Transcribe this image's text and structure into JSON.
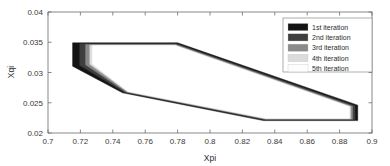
{
  "chart_data": {
    "type": "line",
    "title": "",
    "xlabel": "Xpi",
    "ylabel": "Xqi",
    "xlim": [
      0.7,
      0.9
    ],
    "ylim": [
      0.02,
      0.04
    ],
    "xticks": [
      "0.7",
      "0.72",
      "0.74",
      "0.76",
      "0.78",
      "0.8",
      "0.82",
      "0.84",
      "0.86",
      "0.88",
      "0.9"
    ],
    "xtick_values": [
      0.7,
      0.72,
      0.74,
      0.76,
      0.78,
      0.8,
      0.82,
      0.84,
      0.86,
      0.88,
      0.9
    ],
    "yticks": [
      "0.02",
      "0.025",
      "0.03",
      "0.035",
      "0.04"
    ],
    "ytick_values": [
      0.02,
      0.025,
      0.03,
      0.035,
      0.04
    ],
    "grid": false,
    "legend_position": "top-right",
    "series": [
      {
        "name": "1st iteration",
        "color": "#141414",
        "points": [
          [
            0.7152,
            0.0349
          ],
          [
            0.78,
            0.0349
          ],
          [
            0.8912,
            0.0246
          ],
          [
            0.8912,
            0.02205
          ],
          [
            0.833,
            0.02205
          ],
          [
            0.746,
            0.02665
          ],
          [
            0.7152,
            0.03105
          ]
        ]
      },
      {
        "name": "2nd iteration",
        "color": "#3f3f3f",
        "points": [
          [
            0.7196,
            0.03475
          ],
          [
            0.7795,
            0.03475
          ],
          [
            0.8895,
            0.0245
          ],
          [
            0.8895,
            0.02218
          ],
          [
            0.8335,
            0.02218
          ],
          [
            0.7472,
            0.02672
          ],
          [
            0.7196,
            0.03118
          ]
        ]
      },
      {
        "name": "3rd iteration",
        "color": "#8a8a8a",
        "points": [
          [
            0.7232,
            0.03462
          ],
          [
            0.779,
            0.03462
          ],
          [
            0.888,
            0.02442
          ],
          [
            0.888,
            0.02228
          ],
          [
            0.834,
            0.02228
          ],
          [
            0.7482,
            0.02678
          ],
          [
            0.7232,
            0.03128
          ]
        ]
      },
      {
        "name": "4th iteration",
        "color": "#dcdcdc",
        "points": [
          [
            0.7258,
            0.03452
          ],
          [
            0.7786,
            0.03452
          ],
          [
            0.8868,
            0.02436
          ],
          [
            0.8868,
            0.02236
          ],
          [
            0.8344,
            0.02236
          ],
          [
            0.749,
            0.02683
          ],
          [
            0.7258,
            0.03136
          ]
        ]
      },
      {
        "name": "5th iteration",
        "color": "#ffffff",
        "points": [
          [
            0.7274,
            0.03445
          ],
          [
            0.7783,
            0.03445
          ],
          [
            0.886,
            0.02432
          ],
          [
            0.886,
            0.02242
          ],
          [
            0.8347,
            0.02242
          ],
          [
            0.7495,
            0.02687
          ],
          [
            0.7274,
            0.03141
          ]
        ]
      }
    ]
  },
  "legend": {
    "entries": [
      {
        "label": "1st iteration",
        "color": "#141414"
      },
      {
        "label": "2nd iteration",
        "color": "#3f3f3f"
      },
      {
        "label": "3rd iteration",
        "color": "#8a8a8a"
      },
      {
        "label": "4th iteration",
        "color": "#dcdcdc"
      },
      {
        "label": "5th iteration",
        "color": "#fdfdfd"
      }
    ]
  }
}
